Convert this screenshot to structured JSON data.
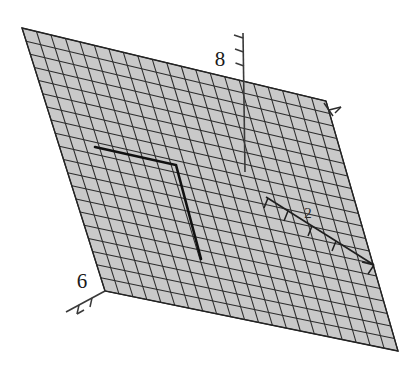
{
  "figure": {
    "title": "",
    "background_color": "#ffffff",
    "surface_fill_color": "#c9c9c9",
    "grid_line_color": "#2b2b2b",
    "axis_line_color": "#3a3a3a",
    "highlight_line_color": "#111111"
  },
  "axes": {
    "vertical_axis": {
      "name": "vertical-axis",
      "tick_label": "8",
      "tick_count": 3,
      "line_start": [
        243,
        33
      ],
      "line_end": [
        245,
        172
      ]
    },
    "left_axis": {
      "name": "left-axis",
      "tick_label": "6",
      "tick_count": 2,
      "line_start": [
        105,
        291
      ],
      "line_end": [
        63,
        314
      ]
    },
    "diagonal_axis": {
      "name": "diagonal-axis",
      "tick_label": "2",
      "tick_count": 4,
      "line_start": [
        266,
        196
      ],
      "line_end": [
        372,
        266
      ]
    },
    "right_axis": {
      "name": "right-axis",
      "tick_label": "",
      "tick_count": 1,
      "line_start": [
        325,
        101
      ],
      "line_end": [
        345,
        118
      ]
    }
  },
  "surface": {
    "name": "mesh-surface",
    "corners": {
      "top_left": [
        22,
        28
      ],
      "top_right": [
        326,
        101
      ],
      "bottom_right": [
        398,
        351
      ],
      "bottom_left": [
        105,
        291
      ]
    },
    "grid_columns": 21,
    "grid_rows": 20,
    "fill": "#c9c9c9",
    "stroke": "#2b2b2b"
  },
  "highlight_path": {
    "name": "highlight-corner-path",
    "points": [
      [
        95,
        147
      ],
      [
        176,
        165
      ],
      [
        201,
        259
      ]
    ],
    "stroke": "#111111",
    "stroke_width": 2.6
  },
  "chart_data": {
    "type": "surface",
    "title": "",
    "xlabel": "",
    "ylabel": "",
    "zlabel": "",
    "tick_labels": {
      "vertical": "8",
      "left": "6",
      "diagonal": "2"
    },
    "grid": {
      "columns": 21,
      "rows": 20
    },
    "series": [
      {
        "name": "surface-mesh",
        "values": []
      },
      {
        "name": "highlight-polyline",
        "values": [
          [
            95,
            147
          ],
          [
            176,
            165
          ],
          [
            201,
            259
          ]
        ]
      }
    ],
    "legend_position": "none",
    "grid_on": true
  }
}
